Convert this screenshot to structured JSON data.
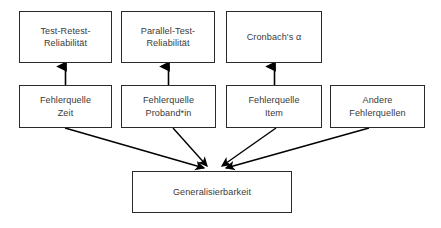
{
  "diagram": {
    "type": "flowchart",
    "colors": {
      "background": "#ffffff",
      "box_border": "#2b2b2b",
      "box_fill": "#ffffff",
      "text": "#3a3a3a",
      "edge": "#000000"
    },
    "nodes": {
      "reliability_methods": [
        {
          "id": "test-retest",
          "label": "Test-Retest-\nReliabilität",
          "row": "top"
        },
        {
          "id": "parallel-test",
          "label": "Parallel-Test-\nReliabilität",
          "row": "top"
        },
        {
          "id": "cronbach-alpha",
          "label": "Cronbach's α",
          "row": "top"
        }
      ],
      "error_sources": [
        {
          "id": "source-time",
          "label": "Fehlerquelle\nZeit",
          "row": "middle"
        },
        {
          "id": "source-person",
          "label": "Fehlerquelle\nProband*in",
          "row": "middle"
        },
        {
          "id": "source-item",
          "label": "Fehlerquelle\nItem",
          "row": "middle"
        },
        {
          "id": "source-other",
          "label": "Andere\nFehlerquellen",
          "row": "middle"
        }
      ],
      "outcome": {
        "id": "generalizability",
        "label": "Generalisierbarkeit",
        "row": "bottom"
      }
    },
    "edges": [
      {
        "from": "source-time",
        "to": "test-retest",
        "direction": "up",
        "style": "solid-arrow"
      },
      {
        "from": "source-person",
        "to": "parallel-test",
        "direction": "up",
        "style": "solid-arrow"
      },
      {
        "from": "source-item",
        "to": "cronbach-alpha",
        "direction": "up",
        "style": "solid-arrow"
      },
      {
        "from": "source-time",
        "to": "generalizability",
        "direction": "down",
        "style": "solid-arrow"
      },
      {
        "from": "source-person",
        "to": "generalizability",
        "direction": "down",
        "style": "solid-arrow"
      },
      {
        "from": "source-item",
        "to": "generalizability",
        "direction": "down",
        "style": "solid-arrow"
      },
      {
        "from": "source-other",
        "to": "generalizability",
        "direction": "down",
        "style": "solid-arrow"
      }
    ]
  }
}
